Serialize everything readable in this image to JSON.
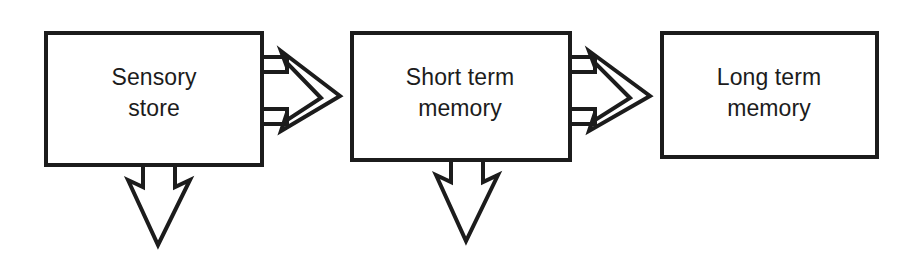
{
  "diagram": {
    "background_color": "#ffffff",
    "stroke_color": "#1c1c1c",
    "fill_color": "#ffffff",
    "boxes": [
      {
        "id": "sensory-store",
        "line1": "Sensory",
        "line2": "store",
        "has_forward_arrow": true,
        "has_down_arrow": true
      },
      {
        "id": "short-term-memory",
        "line1": "Short term",
        "line2": "memory",
        "has_forward_arrow": true,
        "has_down_arrow": true
      },
      {
        "id": "long-term-memory",
        "line1": "Long term",
        "line2": "memory",
        "has_forward_arrow": false,
        "has_down_arrow": false
      }
    ],
    "arrows": [
      {
        "id": "sensory-to-stm",
        "direction": "right",
        "from": "sensory-store",
        "to": "short-term-memory"
      },
      {
        "id": "stm-to-ltm",
        "direction": "right",
        "from": "short-term-memory",
        "to": "long-term-memory"
      },
      {
        "id": "sensory-decay",
        "direction": "down",
        "from": "sensory-store",
        "to": ""
      },
      {
        "id": "stm-decay",
        "direction": "down",
        "from": "short-term-memory",
        "to": ""
      }
    ]
  }
}
